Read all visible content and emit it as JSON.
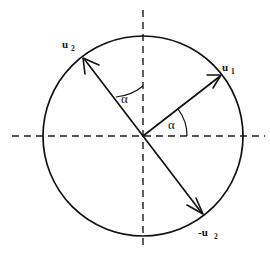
{
  "figure": {
    "type": "unit-circle-vector-diagram",
    "background_color": "#ffffff",
    "stroke_color": "#111111",
    "canvas": {
      "width": 270,
      "height": 253
    },
    "circle": {
      "center_x": 143,
      "center_y": 136,
      "radius": 100,
      "label": "unit-circle"
    },
    "axes": {
      "horizontal": {
        "x1": 12,
        "y1": 136,
        "x2": 265,
        "y2": 136,
        "style": "dashed"
      },
      "vertical": {
        "x1": 143,
        "y1": 10,
        "x2": 143,
        "y2": 248,
        "style": "dashed"
      }
    },
    "vectors": [
      {
        "name": "u1",
        "label": "u",
        "subscript": "1",
        "angle_deg": 38,
        "tip_x": 222,
        "tip_y": 74,
        "label_x": 228,
        "label_y": 70
      },
      {
        "name": "u2",
        "label": "u",
        "subscript": "2",
        "angle_deg": 128,
        "tip_x": 82,
        "tip_y": 57,
        "label_x": 62,
        "label_y": 47
      },
      {
        "name": "-u2",
        "label": "-u",
        "subscript": "2",
        "angle_deg": -52,
        "tip_x": 204,
        "tip_y": 215,
        "label_x": 205,
        "label_y": 233
      }
    ],
    "angles": [
      {
        "name": "alpha-u1-horizontal",
        "symbol": "α",
        "between": [
          "u1",
          "horizontal-axis"
        ],
        "label_x": 172,
        "label_y": 126
      },
      {
        "name": "alpha-u2-vertical",
        "symbol": "α",
        "between": [
          "u2",
          "vertical-axis"
        ],
        "label_x": 124,
        "label_y": 102
      }
    ]
  }
}
